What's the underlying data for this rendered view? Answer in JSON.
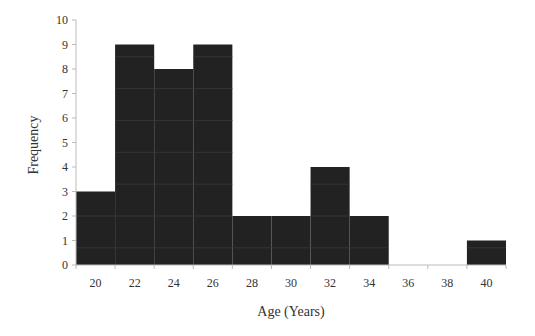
{
  "chart_data": {
    "type": "bar",
    "subtype": "histogram",
    "title": "",
    "xlabel": "Age (Years)",
    "ylabel": "Frequency",
    "bin_width": 2,
    "bins": [
      {
        "start": 19,
        "end": 21,
        "center": 20,
        "count": 3
      },
      {
        "start": 21,
        "end": 23,
        "center": 22,
        "count": 9
      },
      {
        "start": 23,
        "end": 25,
        "center": 24,
        "count": 8
      },
      {
        "start": 25,
        "end": 27,
        "center": 26,
        "count": 9
      },
      {
        "start": 27,
        "end": 29,
        "center": 28,
        "count": 2
      },
      {
        "start": 29,
        "end": 31,
        "center": 30,
        "count": 2
      },
      {
        "start": 31,
        "end": 33,
        "center": 32,
        "count": 4
      },
      {
        "start": 33,
        "end": 35,
        "center": 34,
        "count": 2
      },
      {
        "start": 35,
        "end": 37,
        "center": 36,
        "count": 0
      },
      {
        "start": 37,
        "end": 39,
        "center": 38,
        "count": 0
      },
      {
        "start": 39,
        "end": 41,
        "center": 40,
        "count": 1
      }
    ],
    "categories": [
      "20",
      "22",
      "24",
      "26",
      "28",
      "30",
      "32",
      "34",
      "36",
      "38",
      "40"
    ],
    "values": [
      3,
      9,
      8,
      9,
      2,
      2,
      4,
      2,
      0,
      0,
      1
    ],
    "xlim": [
      19,
      41
    ],
    "ylim": [
      0,
      10
    ],
    "yticks": [
      "0",
      "1",
      "2",
      "3",
      "4",
      "5",
      "6",
      "7",
      "8",
      "9",
      "10"
    ],
    "xticks": [
      "20",
      "22",
      "24",
      "26",
      "28",
      "30",
      "32",
      "34",
      "36",
      "38",
      "40"
    ],
    "grid": false,
    "legend": "none",
    "bar_color": "#222222",
    "axis_color": "#bbbbbb"
  }
}
